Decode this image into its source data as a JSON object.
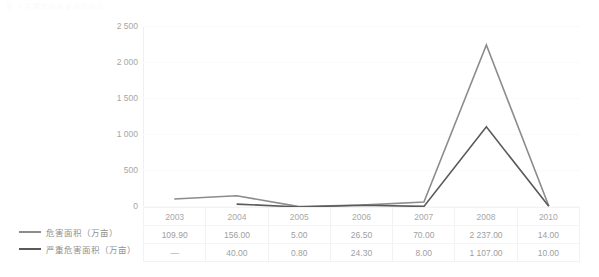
{
  "top_caption": "表 3  主要年份危害面积统计",
  "chart_data": {
    "type": "line",
    "title": "",
    "xlabel": "",
    "ylabel": "",
    "categories": [
      "2003",
      "2004",
      "2005",
      "2006",
      "2007",
      "2008",
      "2010"
    ],
    "ylim": [
      0,
      2500
    ],
    "yticks": [
      "0",
      "500",
      "1 000",
      "1 500",
      "2 000",
      "2 500"
    ],
    "ytick_values": [
      0,
      500,
      1000,
      1500,
      2000,
      2500
    ],
    "grid": true,
    "legend_position": "bottom-left",
    "series": [
      {
        "name": "危害面积（万亩）",
        "color": "#8c8c8c",
        "values": [
          109.9,
          156.0,
          5.0,
          26.5,
          70.0,
          2237.0,
          14.0
        ],
        "labels": [
          "109.90",
          "156.00",
          "5.00",
          "26.50",
          "70.00",
          "2 237.00",
          "14.00"
        ]
      },
      {
        "name": "严重危害面积（万亩）",
        "color": "#5a5a5a",
        "values": [
          null,
          40.0,
          0.8,
          24.3,
          8.0,
          1107.0,
          10.0
        ],
        "labels": [
          "—",
          "40.00",
          "0.80",
          "24.30",
          "8.00",
          "1 107.00",
          "10.00"
        ]
      }
    ]
  },
  "table": {
    "rows": [
      {
        "cells": [
          "2003",
          "2004",
          "2005",
          "2006",
          "2007",
          "2008",
          "2010"
        ]
      },
      {
        "cells": [
          "109.90",
          "156.00",
          "5.00",
          "26.50",
          "70.00",
          "2 237.00",
          "14.00"
        ]
      },
      {
        "cells": [
          "—",
          "40.00",
          "0.80",
          "24.30",
          "8.00",
          "1 107.00",
          "10.00"
        ]
      }
    ]
  },
  "colors": {
    "series_1": "#8c8c8c",
    "series_2": "#5a5a5a",
    "grid": "#fafafb",
    "axis": "#f0f0f2",
    "tick_text": "#a6a6a6",
    "table_border": "#f2f2f4"
  }
}
